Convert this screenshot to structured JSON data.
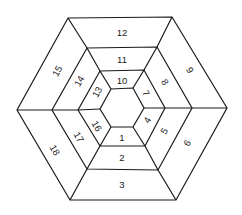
{
  "diagram": {
    "rings": [
      {
        "name": "outer",
        "vertices": [
          [
            68,
            18
          ],
          [
            172,
            17
          ],
          [
            227,
            108
          ],
          [
            176,
            200
          ],
          [
            70,
            200
          ],
          [
            17,
            110
          ]
        ]
      },
      {
        "name": "ring2",
        "vertices": [
          [
            87,
            48
          ],
          [
            157,
            47
          ],
          [
            192,
            108
          ],
          [
            158,
            170
          ],
          [
            87,
            169
          ],
          [
            52,
            110
          ]
        ]
      },
      {
        "name": "ring3",
        "vertices": [
          [
            100,
            71
          ],
          [
            144,
            70
          ],
          [
            165,
            108
          ],
          [
            145,
            146
          ],
          [
            100,
            146
          ],
          [
            78,
            110
          ]
        ]
      },
      {
        "name": "inner",
        "vertices": [
          [
            111,
            89
          ],
          [
            133,
            88
          ],
          [
            144,
            108
          ],
          [
            133,
            127
          ],
          [
            111,
            127
          ],
          [
            100,
            109
          ]
        ]
      }
    ],
    "segments": [
      {
        "label": "1",
        "x": 122,
        "y": 137,
        "rotate": 0
      },
      {
        "label": "2",
        "x": 122,
        "y": 157,
        "rotate": 0
      },
      {
        "label": "3",
        "x": 122,
        "y": 184,
        "rotate": 0
      },
      {
        "label": "4",
        "x": 147,
        "y": 120,
        "rotate": -60
      },
      {
        "label": "5",
        "x": 164,
        "y": 131,
        "rotate": -60
      },
      {
        "label": "6",
        "x": 187,
        "y": 143,
        "rotate": -60
      },
      {
        "label": "7",
        "x": 146,
        "y": 93,
        "rotate": 60
      },
      {
        "label": "8",
        "x": 165,
        "y": 82,
        "rotate": 60
      },
      {
        "label": "9",
        "x": 190,
        "y": 70,
        "rotate": 60
      },
      {
        "label": "10",
        "x": 122,
        "y": 80,
        "rotate": 0
      },
      {
        "label": "11",
        "x": 122,
        "y": 59,
        "rotate": 0
      },
      {
        "label": "12",
        "x": 122,
        "y": 32,
        "rotate": 0
      },
      {
        "label": "13",
        "x": 97,
        "y": 92,
        "rotate": -60
      },
      {
        "label": "14",
        "x": 79,
        "y": 81,
        "rotate": -60
      },
      {
        "label": "15",
        "x": 57,
        "y": 71,
        "rotate": -60
      },
      {
        "label": "16",
        "x": 97,
        "y": 126,
        "rotate": 60
      },
      {
        "label": "17",
        "x": 79,
        "y": 137,
        "rotate": 60
      },
      {
        "label": "18",
        "x": 55,
        "y": 150,
        "rotate": 60
      }
    ],
    "colors": {
      "stroke": "#1a1a1a",
      "text": "#222222",
      "background": "#ffffff"
    }
  }
}
